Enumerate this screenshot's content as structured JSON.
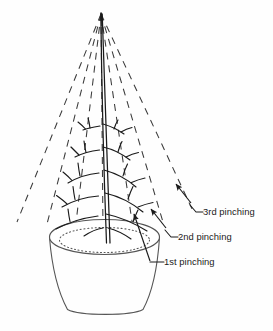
{
  "figure": {
    "kind": "botanical-pruning-diagram",
    "background_color": "#fefefe",
    "ink_color": "#1a1a1a",
    "guide_color": "#3a3a3a",
    "outline_color": "#555555"
  },
  "labels": [
    {
      "id": "third",
      "text": "3rd pinching",
      "x": 203,
      "y": 215,
      "leader": {
        "elbow_x": 196,
        "elbow_y": 211,
        "start_x": 190,
        "start_y": 205
      },
      "arrow": {
        "tail_x": 191,
        "tail_y": 203,
        "tip_x": 176,
        "tip_y": 184
      }
    },
    {
      "id": "second",
      "text": "2nd pinching",
      "x": 178,
      "y": 240,
      "leader": {
        "elbow_x": 171,
        "elbow_y": 236,
        "start_x": 165,
        "start_y": 230
      },
      "arrow": {
        "tail_x": 166,
        "tail_y": 228,
        "tip_x": 151,
        "tip_y": 209
      }
    },
    {
      "id": "first",
      "text": "1st pinching",
      "x": 164,
      "y": 265,
      "leader": {
        "elbow_x": 157,
        "elbow_y": 262,
        "start_x": 150,
        "start_y": 262
      },
      "arrow": {
        "tail_x": 150,
        "tail_y": 261,
        "tip_x": 134,
        "tip_y": 214
      }
    }
  ],
  "plant": {
    "apex": {
      "x": 101,
      "y": 13
    },
    "stem_base": {
      "x": 108,
      "y": 243
    },
    "stem_width_px": 3
  },
  "pot": {
    "rim_center_x": 104,
    "rim_center_y": 237,
    "rim_radius_x": 55,
    "rim_radius_y": 17,
    "base_center_x": 105,
    "base_y": 313,
    "base_half_width": 38,
    "soil_line_radius_x": 45,
    "soil_line_radius_y": 12,
    "soil_line_style": "dotted"
  },
  "cone_guides": {
    "style": "dashed",
    "dash_pattern": "7 6",
    "count": 7,
    "apex_x": 101,
    "apex_y": 14,
    "ends": [
      {
        "x": 17,
        "y": 222
      },
      {
        "x": 46,
        "y": 228
      },
      {
        "x": 75,
        "y": 231
      },
      {
        "x": 103,
        "y": 231
      },
      {
        "x": 133,
        "y": 228
      },
      {
        "x": 163,
        "y": 222
      },
      {
        "x": 193,
        "y": 211
      }
    ]
  },
  "branches": {
    "description": "alternating lateral branches sweeping down and outward from the central leader, each bearing short twigs",
    "tiers": 7
  }
}
